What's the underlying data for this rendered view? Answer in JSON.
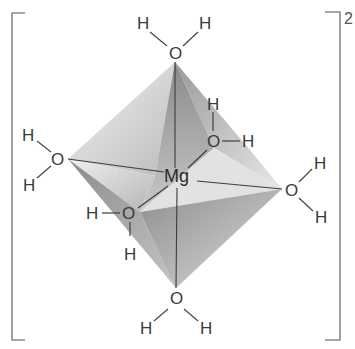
{
  "diagram": {
    "central_atom": "Mg",
    "charge": "2",
    "ligand_oxygen": "O",
    "ligand_hydrogen": "H",
    "geometry": "octahedral",
    "ligands": [
      {
        "position": "top",
        "o": "O",
        "h1": "H",
        "h2": "H"
      },
      {
        "position": "back-right",
        "o": "O",
        "h1": "H",
        "h2": "H"
      },
      {
        "position": "left",
        "o": "O",
        "h1": "H",
        "h2": "H"
      },
      {
        "position": "right",
        "o": "O",
        "h1": "H",
        "h2": "H"
      },
      {
        "position": "front-left",
        "o": "O",
        "h1": "H",
        "h2": "H"
      },
      {
        "position": "bottom",
        "o": "O",
        "h1": "H",
        "h2": "H"
      }
    ],
    "colors": {
      "face_light": "#e6e6e6",
      "face_mid": "#bdbdbd",
      "face_dark": "#8f8f8f",
      "line": "#444444",
      "bracket": "#8a8a8a"
    }
  }
}
